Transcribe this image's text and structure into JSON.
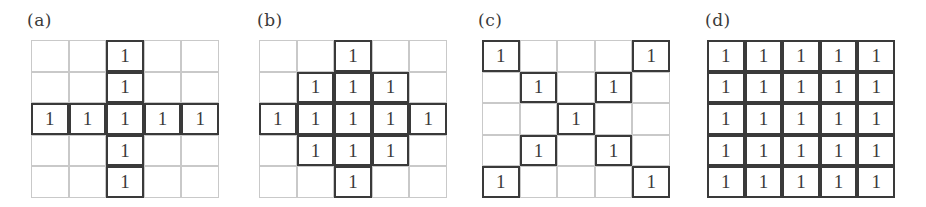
{
  "figure": {
    "panels": [
      {
        "id": "a",
        "label": "(a)",
        "grid": [
          [
            0,
            0,
            1,
            0,
            0
          ],
          [
            0,
            0,
            1,
            0,
            0
          ],
          [
            1,
            1,
            1,
            1,
            1
          ],
          [
            0,
            0,
            1,
            0,
            0
          ],
          [
            0,
            0,
            1,
            0,
            0
          ]
        ]
      },
      {
        "id": "b",
        "label": "(b)",
        "grid": [
          [
            0,
            0,
            1,
            0,
            0
          ],
          [
            0,
            1,
            1,
            1,
            0
          ],
          [
            1,
            1,
            1,
            1,
            1
          ],
          [
            0,
            1,
            1,
            1,
            0
          ],
          [
            0,
            0,
            1,
            0,
            0
          ]
        ]
      },
      {
        "id": "c",
        "label": "(c)",
        "grid": [
          [
            1,
            0,
            0,
            0,
            1
          ],
          [
            0,
            1,
            0,
            1,
            0
          ],
          [
            0,
            0,
            1,
            0,
            0
          ],
          [
            0,
            1,
            0,
            1,
            0
          ],
          [
            1,
            0,
            0,
            0,
            1
          ]
        ]
      },
      {
        "id": "d",
        "label": "(d)",
        "grid": [
          [
            1,
            1,
            1,
            1,
            1
          ],
          [
            1,
            1,
            1,
            1,
            1
          ],
          [
            1,
            1,
            1,
            1,
            1
          ],
          [
            1,
            1,
            1,
            1,
            1
          ],
          [
            1,
            1,
            1,
            1,
            1
          ]
        ]
      }
    ],
    "cell_value_text": "1",
    "colors": {
      "thick_border": "#3a3a3a",
      "thin_border": "#c9c9c9",
      "text": "#3a3a3a",
      "background": "#ffffff"
    }
  }
}
